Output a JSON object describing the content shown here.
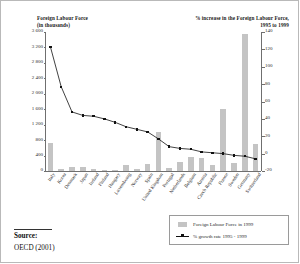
{
  "figure": {
    "title_left": "Foreign Labour Force",
    "subtitle_left": "(in thousands)",
    "title_right": "% increase in the Foreign Labour Force,",
    "subtitle_right": "1995 to 1999"
  },
  "source": {
    "label": "Source:",
    "value": "OECD (2001)"
  },
  "legend": {
    "bar_label": "Foreign Labour Force in 1999",
    "line_label": "% growth rate 1995 - 1999"
  },
  "colors": {
    "bar_fill": "#c4c4c4",
    "line": "#111111",
    "axis": "#6f6f6f",
    "frame": "#b9b9b9"
  },
  "chart_data": {
    "type": "bar",
    "xlabel": "",
    "ylabel": "Foreign Labour Force (in thousands)",
    "y2label": "% increase in the Foreign Labour Force, 1995 to 1999",
    "ylim": [
      0,
      3600
    ],
    "y2lim": [
      -20,
      140
    ],
    "yticks": [
      "0",
      "400",
      "800",
      "1 200",
      "1 600",
      "2 000",
      "2 400",
      "2 800",
      "3 200",
      "3 600"
    ],
    "ytick_values": [
      0,
      400,
      800,
      1200,
      1600,
      2000,
      2400,
      2800,
      3200,
      3600
    ],
    "y2ticks": [
      "-20",
      "0",
      "20",
      "40",
      "60",
      "80",
      "100",
      "120",
      "140"
    ],
    "y2tick_values": [
      -20,
      0,
      20,
      40,
      60,
      80,
      100,
      120,
      140
    ],
    "grid": false,
    "legend_position": "bottom-right",
    "categories": [
      "Italy",
      "Korea",
      "Denmark",
      "Japan",
      "Ireland",
      "Finland",
      "Hungary",
      "Luxembourg",
      "Norway",
      "Spain",
      "United Kingdom",
      "Portugal",
      "Netherlands",
      "Belgium",
      "Austria",
      "Czech Republic",
      "France",
      "Sweden",
      "Germany",
      "Switzerland"
    ],
    "series": [
      {
        "name": "Foreign Labour Force in 1999",
        "type": "bar",
        "axis": "left",
        "units": "thousands",
        "values": [
          730,
          50,
          95,
          110,
          55,
          10,
          30,
          145,
          50,
          180,
          1020,
          90,
          225,
          375,
          325,
          155,
          1600,
          210,
          3545,
          690
        ]
      },
      {
        "name": "% growth rate 1995 - 1999",
        "type": "line",
        "axis": "right",
        "units": "percent",
        "values": [
          123,
          77,
          48,
          44,
          43,
          40,
          36,
          31,
          28,
          25,
          17,
          8,
          6,
          5,
          2,
          1,
          0,
          -2,
          -3,
          -6
        ]
      }
    ]
  }
}
